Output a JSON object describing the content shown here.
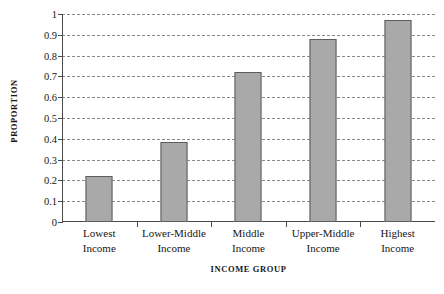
{
  "chart_data": {
    "type": "bar",
    "title": "",
    "xlabel": "INCOME GROUP",
    "ylabel": "PROPORTION",
    "categories": [
      "Lowest Income",
      "Lower-Middle Income",
      "Middle Income",
      "Upper-Middle Income",
      "Highest Income"
    ],
    "category_lines": [
      [
        "Lowest",
        "Income"
      ],
      [
        "Lower-Middle",
        "Income"
      ],
      [
        "Middle",
        "Income"
      ],
      [
        "Upper-Middle",
        "Income"
      ],
      [
        "Highest",
        "Income"
      ]
    ],
    "values": [
      0.22,
      0.385,
      0.72,
      0.88,
      0.97
    ],
    "ylim": [
      0,
      1
    ],
    "ytick_labels": [
      "0",
      "0.1",
      "0.2",
      "0.3",
      "0.4",
      "0.5",
      "0.6",
      "0.7",
      "0.8",
      "0.9",
      "1"
    ],
    "ytick_values": [
      0,
      0.1,
      0.2,
      0.3,
      0.4,
      0.5,
      0.6,
      0.7,
      0.8,
      0.9,
      1
    ],
    "grid": "horizontal-dashed",
    "legend": "none",
    "bar_color": "#a9a9a9",
    "bar_edge_color": "#5d5d5d",
    "axis_color": "#4a4a4a",
    "grid_color": "#8a8a8a",
    "background": "#ffffff"
  }
}
